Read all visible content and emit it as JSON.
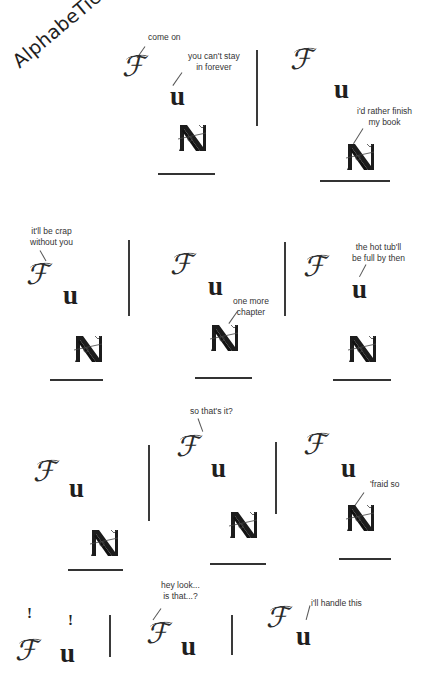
{
  "title": "AlphabeTics",
  "glyphs": {
    "f": "ℱ",
    "u": "u",
    "exclaim": "!"
  },
  "panels": [
    {
      "id": 1,
      "speech": [
        {
          "speaker": "F",
          "text": [
            "come on"
          ]
        },
        {
          "speaker": "u",
          "text": [
            "you can't stay",
            "in forever"
          ]
        }
      ]
    },
    {
      "id": 2,
      "speech": [
        {
          "speaker": "N",
          "text": [
            "i'd rather finish",
            "my book"
          ]
        }
      ]
    },
    {
      "id": 3,
      "speech": [
        {
          "speaker": "F",
          "text": [
            "it'll be crap",
            "without you"
          ]
        }
      ]
    },
    {
      "id": 4,
      "speech": [
        {
          "speaker": "N",
          "text": [
            "one more",
            "chapter"
          ]
        }
      ]
    },
    {
      "id": 5,
      "speech": [
        {
          "speaker": "u",
          "text": [
            "the hot tub'll",
            "be full by then"
          ]
        }
      ]
    },
    {
      "id": 6,
      "speech": []
    },
    {
      "id": 7,
      "speech": [
        {
          "speaker": "F",
          "text": [
            "so that's it?"
          ]
        }
      ]
    },
    {
      "id": 8,
      "speech": [
        {
          "speaker": "N",
          "text": [
            "'fraid so"
          ]
        }
      ]
    },
    {
      "id": 9,
      "speech": [
        {
          "speaker": "F",
          "text": [
            "!"
          ]
        },
        {
          "speaker": "u",
          "text": [
            "!"
          ]
        }
      ]
    },
    {
      "id": 10,
      "speech": [
        {
          "speaker": "F",
          "text": [
            "hey look...",
            "is that...?"
          ]
        }
      ]
    },
    {
      "id": 11,
      "speech": [
        {
          "speaker": "u",
          "text": [
            "i'll handle this"
          ]
        }
      ]
    }
  ]
}
